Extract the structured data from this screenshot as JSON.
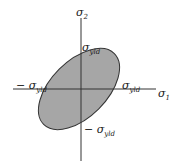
{
  "diagram": {
    "axes": {
      "x_label": {
        "symbol": "σ",
        "sub": "1"
      },
      "y_label": {
        "symbol": "σ",
        "sub": "2"
      }
    },
    "intercepts": {
      "top": {
        "prefix": "",
        "symbol": "σ",
        "sub": "yld"
      },
      "right": {
        "prefix": "",
        "symbol": "σ",
        "sub": "yld"
      },
      "left": {
        "prefix": "− ",
        "symbol": "σ",
        "sub": "yld"
      },
      "bottom": {
        "prefix": "− ",
        "symbol": "σ",
        "sub": "yld"
      }
    },
    "colors": {
      "fill": "#a6a6a6",
      "stroke": "#333333",
      "axis": "#333333",
      "background": "#ffffff"
    }
  }
}
